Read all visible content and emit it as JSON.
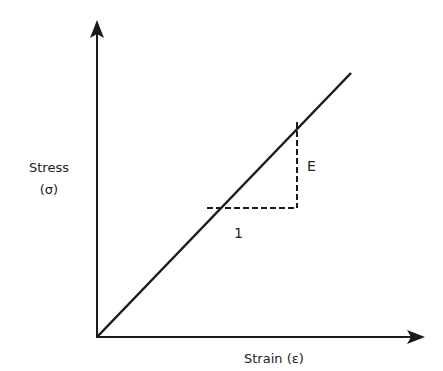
{
  "diagram": {
    "y_axis": {
      "label_line1": "Stress",
      "label_line2": "(σ)"
    },
    "x_axis": {
      "label": "Strain (ε)"
    },
    "slope_triangle": {
      "run_label": "1",
      "rise_label": "E"
    },
    "colors": {
      "line": "#1a1a1a",
      "background": "#ffffff"
    }
  }
}
